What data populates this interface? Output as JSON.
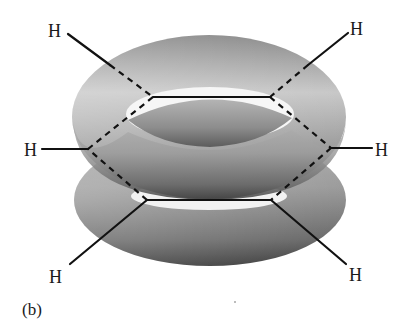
{
  "figure": {
    "panel_label": "(b)",
    "colors": {
      "background": "#ffffff",
      "bond": "#111111",
      "torus_light": "#e6e6e6",
      "torus_mid": "#9a9a9a",
      "torus_dark": "#3c3c3c"
    },
    "atoms": {
      "h_top_left": "H",
      "h_top_right": "H",
      "h_left": "H",
      "h_right": "H",
      "h_bottom_left": "H",
      "h_bottom_right": "H"
    },
    "orbitals": [
      {
        "name": "upper-pi-cloud",
        "shape": "torus"
      },
      {
        "name": "lower-pi-cloud",
        "shape": "torus"
      }
    ],
    "ring": {
      "atoms": 6,
      "vertices": [
        [
          153,
          97
        ],
        [
          270,
          97
        ],
        [
          331,
          148
        ],
        [
          271,
          200
        ],
        [
          147,
          200
        ],
        [
          88,
          149
        ]
      ]
    }
  }
}
